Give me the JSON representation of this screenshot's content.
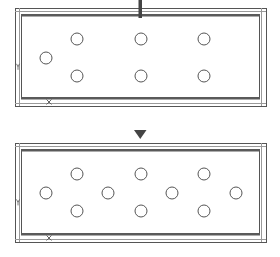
{
  "diagram": {
    "type": "before-after-layout",
    "colors": {
      "line": "#555555",
      "bar": "#5a5a5a",
      "light": "#9a9a9a",
      "bg": "#ffffff"
    },
    "panels": [
      {
        "name": "top-panel",
        "label_y": "Y",
        "label_x": "X",
        "frame": {
          "x": 15,
          "y": 8,
          "w": 251,
          "h": 98
        },
        "circles": [
          {
            "cx": 46,
            "cy": 58
          },
          {
            "cx": 77,
            "cy": 39
          },
          {
            "cx": 77,
            "cy": 76
          },
          {
            "cx": 141,
            "cy": 39
          },
          {
            "cx": 141,
            "cy": 76
          },
          {
            "cx": 204,
            "cy": 39
          },
          {
            "cx": 204,
            "cy": 76
          }
        ]
      },
      {
        "name": "bottom-panel",
        "label_y": "Y",
        "label_x": "X",
        "frame": {
          "x": 15,
          "y": 143,
          "w": 251,
          "h": 99
        },
        "circles": [
          {
            "cx": 46,
            "cy": 193
          },
          {
            "cx": 77,
            "cy": 174
          },
          {
            "cx": 77,
            "cy": 211
          },
          {
            "cx": 108,
            "cy": 193
          },
          {
            "cx": 141,
            "cy": 174
          },
          {
            "cx": 141,
            "cy": 211
          },
          {
            "cx": 172,
            "cy": 193
          },
          {
            "cx": 204,
            "cy": 174
          },
          {
            "cx": 204,
            "cy": 211
          },
          {
            "cx": 236,
            "cy": 193
          }
        ]
      }
    ],
    "arrow": {
      "x": 140,
      "y1": 113,
      "y2": 140,
      "direction": "down"
    }
  }
}
